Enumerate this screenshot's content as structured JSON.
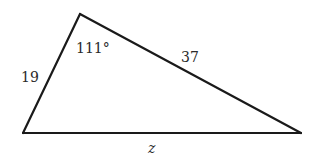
{
  "diagram": {
    "type": "triangle",
    "vertices": {
      "bottom_left": {
        "x": 23,
        "y": 133
      },
      "top": {
        "x": 80,
        "y": 14
      },
      "bottom_right": {
        "x": 301,
        "y": 133
      }
    },
    "labels": {
      "left_side": "19",
      "top_angle": "111°",
      "right_side": "37",
      "bottom_side": "z"
    },
    "colors": {
      "stroke": "#1a1a1a",
      "text": "#2a2a2a",
      "background": "#ffffff"
    }
  }
}
